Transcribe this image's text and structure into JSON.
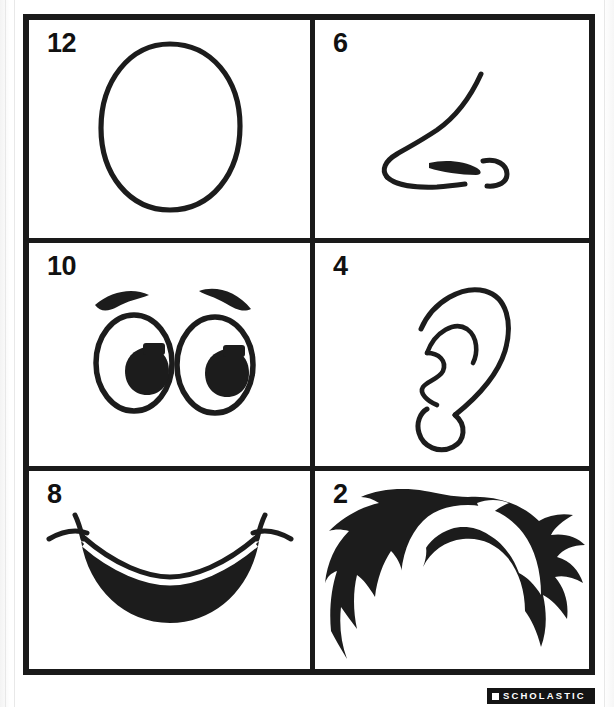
{
  "page": {
    "background_color": "#fcfcfc",
    "ink_color": "#1a1a1a"
  },
  "grid": {
    "columns": 2,
    "rows": 3,
    "cells": [
      {
        "number": "12",
        "art": "egg-oval-face-outline",
        "art_label": "face outline"
      },
      {
        "number": "6",
        "art": "nose-profile",
        "art_label": "nose"
      },
      {
        "number": "10",
        "art": "cartoon-eyes-pair",
        "art_label": "eyes"
      },
      {
        "number": "4",
        "art": "ear-outline",
        "art_label": "ear"
      },
      {
        "number": "8",
        "art": "smiling-mouth",
        "art_label": "mouth"
      },
      {
        "number": "2",
        "art": "spiky-hair-silhouette",
        "art_label": "hair"
      }
    ]
  },
  "footer": {
    "logo_text": "SCHOLASTIC",
    "logo_background": "#141414",
    "logo_foreground": "#ffffff"
  }
}
